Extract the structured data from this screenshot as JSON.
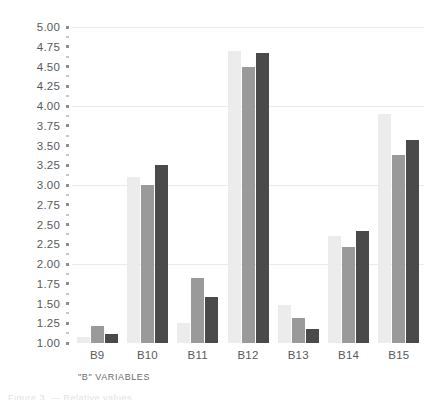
{
  "chart_data": {
    "type": "bar",
    "title": "",
    "subtitle": "",
    "xlabel": "\"B\" VARIABLES",
    "ylabel": "",
    "categories": [
      "B9",
      "B10",
      "B11",
      "B12",
      "B13",
      "B14",
      "B15"
    ],
    "series": [
      {
        "name": "series-1",
        "color": "#ececec",
        "values": [
          1.07,
          3.1,
          1.25,
          4.7,
          1.48,
          2.35,
          3.9
        ]
      },
      {
        "name": "series-2",
        "color": "#9a9a9a",
        "values": [
          1.22,
          3.0,
          1.82,
          4.5,
          1.32,
          2.22,
          3.38
        ]
      },
      {
        "name": "series-3",
        "color": "#4a4a4a",
        "values": [
          1.12,
          3.25,
          1.58,
          4.67,
          1.18,
          2.42,
          3.57
        ]
      }
    ],
    "ylim": [
      1.0,
      5.0
    ],
    "ytick_step": 0.25,
    "ytick_labels": [
      "5.00",
      "4.75",
      "4.50",
      "4.25",
      "4.00",
      "3.75",
      "3.50",
      "3.25",
      "3.00",
      "2.75",
      "2.50",
      "2.25",
      "2.00",
      "1.75",
      "1.50",
      "1.25",
      "1.00"
    ],
    "gridlines": [
      2.0,
      3.0,
      4.0,
      5.0
    ],
    "grid": true,
    "legend": "none",
    "legend_position": "none",
    "bar_orientation": "vertical",
    "group_count": 7,
    "series_count": 3
  },
  "footer": {
    "cropped_text": "Figure 3. — Relative values"
  }
}
